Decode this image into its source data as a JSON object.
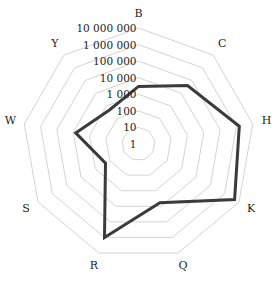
{
  "chart_data": {
    "type": "radar",
    "title": "",
    "scale": "log10",
    "axes": [
      "B",
      "C",
      "H",
      "K",
      "Q",
      "R",
      "S",
      "W",
      "Y"
    ],
    "tick_labels": [
      "1",
      "10",
      "100",
      "1 000",
      "10 000",
      "100 000",
      "1 000 000",
      "10 000 000"
    ],
    "tick_values": [
      1,
      10,
      100,
      1000,
      10000,
      100000,
      1000000,
      10000000
    ],
    "range": [
      1,
      10000000
    ],
    "grid": true,
    "legend": null,
    "series": [
      {
        "name": "series-1",
        "color": "#3b3b3b",
        "values": [
          3000,
          40000,
          1500000,
          5000000,
          6000,
          1000000,
          200,
          7000,
          500
        ]
      }
    ]
  },
  "colors": {
    "grid": "#d4d4d4",
    "line": "#3b3b3b",
    "text": "#222222",
    "background": "#ffffff"
  }
}
